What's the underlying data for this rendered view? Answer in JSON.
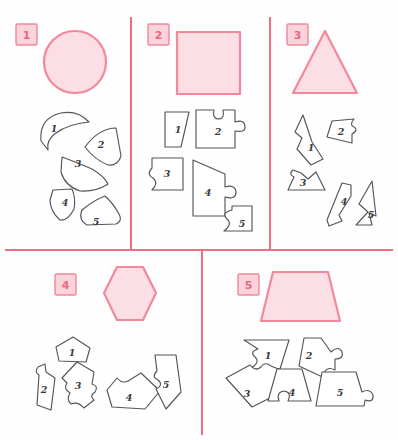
{
  "page": {
    "width": 398,
    "height": 440,
    "background": "#fefefe",
    "kind": "shape-dissection-puzzle-worksheet"
  },
  "colors": {
    "divider": "#ef6d85",
    "target_fill": "#fbdfe4",
    "target_stroke": "#f4879a",
    "label_box_fill": "#fbd3da",
    "label_box_stroke": "#f0889c",
    "label_text": "#e8687f",
    "piece_fill": "#ffffff",
    "piece_stroke": "#555558",
    "piece_label": "#3a3a3c"
  },
  "layout": {
    "dividers": [
      {
        "name": "vertical-divider-left",
        "x1": 131,
        "y1": 18,
        "x2": 131,
        "y2": 250
      },
      {
        "name": "vertical-divider-right",
        "x1": 270,
        "y1": 18,
        "x2": 270,
        "y2": 250
      },
      {
        "name": "horizontal-divider",
        "x1": 6,
        "y1": 250,
        "x2": 392,
        "y2": 250
      },
      {
        "name": "vertical-divider-bottom",
        "x1": 202,
        "y1": 250,
        "x2": 202,
        "y2": 434
      }
    ]
  },
  "panels": [
    {
      "id": "panel-1",
      "label": "1",
      "label_box": {
        "x": 16,
        "y": 24,
        "w": 21,
        "h": 21
      },
      "target": {
        "name": "circle",
        "shape": "circle",
        "cx": 75,
        "cy": 62,
        "r": 31
      },
      "pieces": [
        {
          "label": "1",
          "lx": 54,
          "ly": 128
        },
        {
          "label": "2",
          "lx": 101,
          "ly": 144
        },
        {
          "label": "3",
          "lx": 78,
          "ly": 163
        },
        {
          "label": "4",
          "lx": 65,
          "ly": 202
        },
        {
          "label": "5",
          "lx": 96,
          "ly": 221
        }
      ]
    },
    {
      "id": "panel-2",
      "label": "2",
      "label_box": {
        "x": 148,
        "y": 24,
        "w": 21,
        "h": 21
      },
      "target": {
        "name": "square",
        "shape": "rect",
        "x": 177,
        "y": 32,
        "w": 63,
        "h": 62
      },
      "pieces": [
        {
          "label": "1",
          "lx": 178,
          "ly": 129
        },
        {
          "label": "2",
          "lx": 218,
          "ly": 131
        },
        {
          "label": "3",
          "lx": 167,
          "ly": 173
        },
        {
          "label": "4",
          "lx": 208,
          "ly": 192
        },
        {
          "label": "5",
          "lx": 242,
          "ly": 223
        }
      ]
    },
    {
      "id": "panel-3",
      "label": "3",
      "label_box": {
        "x": 287,
        "y": 24,
        "w": 21,
        "h": 21
      },
      "target": {
        "name": "triangle",
        "shape": "polygon",
        "points": "325,31 293,93 357,93"
      },
      "pieces": [
        {
          "label": "1",
          "lx": 311,
          "ly": 147
        },
        {
          "label": "2",
          "lx": 341,
          "ly": 131
        },
        {
          "label": "3",
          "lx": 303,
          "ly": 182
        },
        {
          "label": "4",
          "lx": 344,
          "ly": 201
        },
        {
          "label": "5",
          "lx": 371,
          "ly": 214
        }
      ]
    },
    {
      "id": "panel-4",
      "label": "4",
      "label_box": {
        "x": 55,
        "y": 274,
        "w": 21,
        "h": 21
      },
      "target": {
        "name": "hexagon",
        "shape": "polygon",
        "points": "117,267 143,267 156,293 143,320 117,320 104,293"
      },
      "pieces": [
        {
          "label": "1",
          "lx": 72,
          "ly": 352
        },
        {
          "label": "2",
          "lx": 44,
          "ly": 389
        },
        {
          "label": "3",
          "lx": 78,
          "ly": 385
        },
        {
          "label": "4",
          "lx": 129,
          "ly": 397
        },
        {
          "label": "5",
          "lx": 166,
          "ly": 384
        }
      ]
    },
    {
      "id": "panel-5",
      "label": "5",
      "label_box": {
        "x": 238,
        "y": 274,
        "w": 21,
        "h": 21
      },
      "target": {
        "name": "trapezoid",
        "shape": "polygon",
        "points": "273,272 328,272 340,321 261,321"
      },
      "pieces": [
        {
          "label": "1",
          "lx": 268,
          "ly": 355
        },
        {
          "label": "2",
          "lx": 309,
          "ly": 355
        },
        {
          "label": "3",
          "lx": 247,
          "ly": 393
        },
        {
          "label": "4",
          "lx": 292,
          "ly": 392
        },
        {
          "label": "5",
          "lx": 340,
          "ly": 392
        }
      ]
    }
  ],
  "piece_paths": {
    "p1_1": "M41,141 Q39,118 61,113 Q78,110 89,122 Q68,124 56,133 Q46,140 48,150 Z",
    "p1_2": "M85,147 Q99,128 116,128 L121,156 Q118,166 108,165 Q95,160 85,147 Z",
    "p1_3": "M62,157 Q76,162 92,169 Q104,176 108,184 Q96,192 80,191 Q65,186 61,172 Z",
    "p1_4": "M53,190 L72,189 Q76,198 74,209 Q68,221 60,220 Q50,211 50,200 Z",
    "p1_5": "M82,210 Q94,200 105,196 Q113,203 119,214 Q123,221 116,224 L87,225 Q78,220 82,210 Z",
    "p2_1": "M165,112 L189,112 L181,147 L165,147 Z",
    "p2_2": "M196,110 L214,110 Q212,118 218,119 Q225,119 223,110 L235,110 L235,122 Q244,119 245,126 Q246,133 235,131 L235,148 L196,148 Z",
    "p2_3": "M152,158 L183,158 L183,190 L152,190 Q159,183 153,178 Q146,174 152,168 Z",
    "p2_4": "M193,160 L225,174 L225,187 Q235,184 236,192 Q236,200 225,197 L225,216 L193,216 Z",
    "p2_5": "M232,206 L252,206 L252,231 L224,231 Q233,224 227,219 Q221,213 232,210 Z",
    "p3_1": "M303,115 L312,142 L323,159 L311,165 L297,149 L302,138 L295,132 Z",
    "p3_2": "M327,137 L332,121 L354,119 Q349,125 354,127 Q359,130 352,134 L352,143 Z",
    "p3_3": "M288,190 L294,177 Q288,174 293,170 L301,173 L308,179 L316,172 L325,190 Z",
    "p3_4": "M327,220 L342,183 L351,185 L351,196 L339,215 L342,221 L329,226 Z",
    "p3_5": "M356,225 L368,212 L359,204 L372,181 L376,216 L369,213 L372,225 Z",
    "p4_1": "M56,347 L73,337 L90,348 L86,362 L59,361 Z",
    "p4_2": "M38,367 Q34,372 39,375 L37,405 L51,410 L55,378 L46,372 L45,364 Z",
    "p4_3": "M62,378 L77,362 L94,372 L92,384 Q99,386 95,392 Q89,396 94,400 L84,408 Q78,401 71,404 Q66,400 70,393 Q63,389 67,383 Z",
    "p4_4": "M107,390 L117,378 Q122,384 128,381 L141,373 L160,391 L145,409 L112,407 Z",
    "p4_5": "M155,355 L176,355 L181,392 L166,409 L156,389 Q164,385 158,380 Q151,377 157,371 Z",
    "p5_1": "M244,340 L289,340 L280,369 L250,369 Q261,362 255,357 Q249,352 258,349 Z",
    "p5_2": "M304,338 L321,338 L331,352 Q339,345 342,352 Q344,359 335,359 L335,370 Q327,366 324,373 Q322,381 331,381 L299,366 Z",
    "p5_3": "M226,378 L250,365 Q255,372 261,367 Q265,361 271,366 L288,373 L279,378 Q285,383 279,387 Q272,390 276,395 L252,407 Z",
    "p5_4": "M277,369 L302,369 L311,401 L288,401 Q292,392 284,391 Q276,392 279,401 L268,401 Z",
    "p5_5": "M322,372 L356,372 L362,392 Q370,388 373,395 Q374,403 365,400 L364,406 L316,406 Z"
  }
}
